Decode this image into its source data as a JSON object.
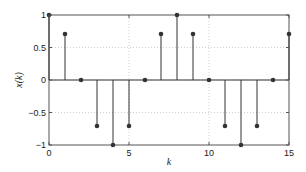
{
  "chart_data": {
    "type": "stem",
    "title": "",
    "xlabel": "k",
    "ylabel": "x(k)",
    "x": [
      0,
      1,
      2,
      3,
      4,
      5,
      6,
      7,
      8,
      9,
      10,
      11,
      12,
      13,
      14,
      15
    ],
    "values": [
      1,
      0.707,
      0,
      -0.707,
      -1,
      -0.707,
      0,
      0.707,
      1,
      0.707,
      0,
      -0.707,
      -1,
      -0.707,
      0,
      0.707
    ],
    "xlim": [
      0,
      15
    ],
    "ylim": [
      -1,
      1
    ],
    "xticks": [
      0,
      5,
      10,
      15
    ],
    "xtick_labels": [
      "0",
      "5",
      "10",
      "15"
    ],
    "yticks": [
      1,
      0.5,
      0,
      -0.5,
      -1
    ],
    "ytick_labels": [
      "1",
      "0.5",
      "0",
      "−0.5",
      "−1"
    ],
    "grid": true,
    "legend": null
  },
  "colors": {
    "stem": "#333333",
    "axis": "#555555",
    "grid": "#bbbbbb"
  }
}
